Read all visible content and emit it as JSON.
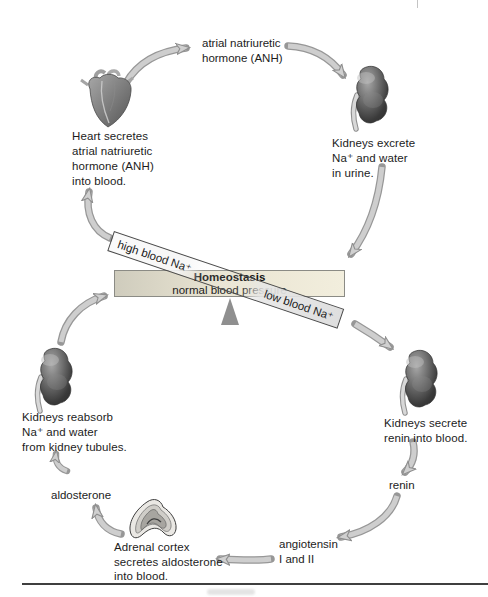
{
  "labels": {
    "anh_line1": "atrial natriuretic",
    "anh_line2": "hormone (ANH)",
    "renin": "renin",
    "angiotensin_line1": "angiotensin",
    "angiotensin_line2": "I and II",
    "aldosterone": "aldosterone"
  },
  "captions": {
    "heart": [
      "Heart secretes",
      "atrial natriuretic",
      "hormone (ANH)",
      "into blood."
    ],
    "kidney_excrete": [
      "Kidneys excrete",
      "Na⁺  and water",
      "in urine."
    ],
    "kidney_reabsorb": [
      "Kidneys reabsorb",
      "Na⁺  and water",
      "from kidney tubules."
    ],
    "kidney_secrete": [
      "Kidneys secrete",
      "renin into blood."
    ],
    "adrenal": [
      "Adrenal cortex",
      "secretes aldosterone",
      "into blood."
    ]
  },
  "homeostasis": {
    "title": "Homeostasis",
    "subtitle": "normal blood pressure",
    "high_label": "high blood Na⁺",
    "low_label": "low blood Na⁺"
  },
  "icons": {
    "heart": "heart-illustration",
    "kidney_top_right": "kidney-illustration",
    "kidney_bottom_left": "kidney-illustration",
    "kidney_bottom_right": "kidney-illustration",
    "adrenal": "adrenal-gland-illustration"
  },
  "colors": {
    "background": "#ffffff",
    "text": "#1c1c1c",
    "bar_fill_left": "#cfccbd",
    "bar_fill_right": "#f2eedd",
    "bar_border": "#8b8b85",
    "band_border": "#4a4a4a",
    "arrow_fill": "#cecece",
    "arrow_outline": "#979797",
    "fulcrum_triangle": "#8f8f8f",
    "organ_dark_gray": "#565656",
    "bottom_rule": "#3f3f3f"
  }
}
